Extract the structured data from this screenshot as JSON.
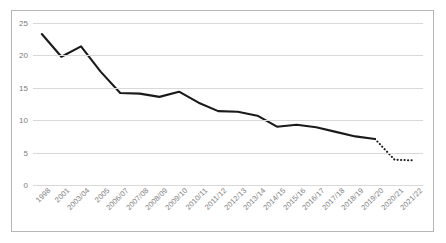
{
  "chart_data": {
    "type": "line",
    "title": "",
    "subtitle": "",
    "xlabel": "",
    "ylabel": "",
    "grid": true,
    "legend": false,
    "legend_position": "none",
    "ylim": [
      0,
      25
    ],
    "yticks": [
      0,
      5,
      10,
      15,
      20,
      25
    ],
    "ytick_labels": [
      "0",
      "5",
      "10",
      "15",
      "20",
      "25"
    ],
    "categories": [
      "1998",
      "2001",
      "2003/04",
      "2005",
      "2006/07",
      "2007/08",
      "2008/09",
      "2009/10",
      "2010/11",
      "2011/12",
      "2012/13",
      "2013/14",
      "2014/15",
      "2015/16",
      "2016/17",
      "2017/18",
      "2018/19",
      "2019/20",
      "2020/21",
      "2021/22"
    ],
    "series": [
      {
        "name": "Prevalence",
        "color": "#1a1a1a",
        "values": [
          23.3,
          19.8,
          21.4,
          17.5,
          14.2,
          14.1,
          13.6,
          14.4,
          12.7,
          11.4,
          11.3,
          10.7,
          9.0,
          9.3,
          8.9,
          8.2,
          7.5,
          7.1,
          3.9,
          3.8
        ],
        "solid_to_index": 17,
        "dotted_from_index": 17,
        "style": "solid-then-dotted"
      }
    ],
    "colors": {
      "line": "#1a1a1a",
      "gridline": "#d9d9d9",
      "tick_label": "#7c7c7c",
      "frame_border": "#b6b6b6",
      "background": "#ffffff"
    }
  }
}
